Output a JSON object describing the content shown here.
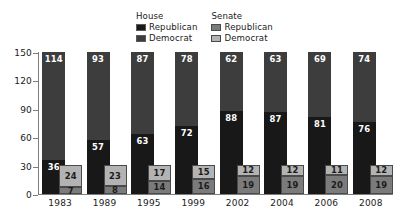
{
  "chart_data": {
    "type": "bar",
    "subtype": "stacked-grouped",
    "title": "",
    "xlabel": "",
    "ylabel": "",
    "ylim": [
      0,
      150
    ],
    "yticks": [
      0,
      30,
      60,
      90,
      120,
      150
    ],
    "grid": false,
    "legend_position": "top-center",
    "categories": [
      "1983",
      "1989",
      "1995",
      "1999",
      "2002",
      "2004",
      "2006",
      "2008"
    ],
    "groups": [
      {
        "name": "House",
        "series": [
          {
            "name": "Republican",
            "values": [
              36,
              57,
              63,
              72,
              88,
              87,
              81,
              76
            ]
          },
          {
            "name": "Democrat",
            "values": [
              114,
              93,
              87,
              78,
              62,
              63,
              69,
              74
            ]
          }
        ]
      },
      {
        "name": "Senate",
        "series": [
          {
            "name": "Republican",
            "values": [
              7,
              8,
              14,
              16,
              19,
              19,
              20,
              19
            ]
          },
          {
            "name": "Democrat",
            "values": [
              24,
              23,
              17,
              15,
              12,
              12,
              11,
              12
            ]
          }
        ]
      }
    ]
  },
  "legend": {
    "groups": [
      {
        "title": "House",
        "entries": [
          {
            "label": "Republican",
            "color": "#181818"
          },
          {
            "label": "Democrat",
            "color": "#3d3d3d"
          }
        ]
      },
      {
        "title": "Senate",
        "entries": [
          {
            "label": "Republican",
            "color": "#7b7b7b"
          },
          {
            "label": "Democrat",
            "color": "#b3b3b3"
          }
        ]
      }
    ]
  },
  "axes": {
    "y": {
      "ticks": [
        "0",
        "30",
        "60",
        "90",
        "120",
        "150"
      ],
      "max": 150,
      "min": 0
    },
    "x": {
      "ticks": [
        "1983",
        "1989",
        "1995",
        "1999",
        "2002",
        "2004",
        "2006",
        "2008"
      ]
    }
  },
  "colors": {
    "house_republican": "#181818",
    "house_democrat": "#3d3d3d",
    "senate_republican": "#7b7b7b",
    "senate_democrat": "#b3b3b3",
    "axis": "#7d7d7d",
    "text": "#1b1b1b",
    "background": "#ffffff"
  }
}
